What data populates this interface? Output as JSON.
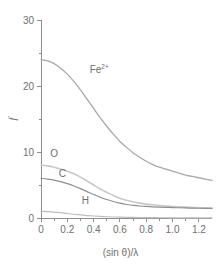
{
  "chart_data": {
    "type": "line",
    "title": "",
    "xlabel": "(sin θ)/λ",
    "ylabel": "f",
    "xlim": [
      0,
      1.3
    ],
    "ylim": [
      0,
      30
    ],
    "grid": false,
    "legend_position": "inline-labels",
    "x_ticks": [
      0,
      0.2,
      0.4,
      0.6,
      0.8,
      1.0,
      1.2
    ],
    "x_tick_labels": [
      "0",
      "0.2",
      "0.4",
      "0.6",
      "0.8",
      "1.0",
      "1.2"
    ],
    "x_minor_ticks": [
      0.1,
      0.3,
      0.5,
      0.7,
      0.9,
      1.1
    ],
    "y_ticks": [
      0,
      10,
      20,
      30
    ],
    "y_tick_labels": [
      "0",
      "10",
      "20",
      "30"
    ],
    "y_minor_ticks": [
      5,
      15,
      25
    ],
    "x": [
      0,
      0.05,
      0.1,
      0.15,
      0.2,
      0.25,
      0.3,
      0.35,
      0.4,
      0.45,
      0.5,
      0.55,
      0.6,
      0.65,
      0.7,
      0.75,
      0.8,
      0.85,
      0.9,
      0.95,
      1.0,
      1.05,
      1.1,
      1.15,
      1.2,
      1.25,
      1.3
    ],
    "series": [
      {
        "name": "Fe2+",
        "label": "Fe",
        "label_sup": "2+",
        "color": "#a8a8a8",
        "width": 1.3,
        "label_x": 0.37,
        "label_y": 22.0,
        "values": [
          24.0,
          23.8,
          23.4,
          22.7,
          21.8,
          20.7,
          19.4,
          18.0,
          16.6,
          15.2,
          13.9,
          12.7,
          11.6,
          10.7,
          9.9,
          9.2,
          8.6,
          8.1,
          7.7,
          7.4,
          7.1,
          6.8,
          6.5,
          6.3,
          6.1,
          5.9,
          5.7
        ]
      },
      {
        "name": "O",
        "label": "O",
        "label_sup": "",
        "color": "#c9c9c9",
        "width": 1.6,
        "label_x": 0.07,
        "label_y": 9.3,
        "values": [
          8.0,
          7.9,
          7.7,
          7.4,
          7.1,
          6.7,
          6.2,
          5.6,
          5.0,
          4.4,
          3.9,
          3.4,
          3.0,
          2.7,
          2.45,
          2.25,
          2.1,
          2.0,
          1.9,
          1.82,
          1.75,
          1.7,
          1.65,
          1.6,
          1.56,
          1.53,
          1.5
        ]
      },
      {
        "name": "C",
        "label": "C",
        "label_sup": "",
        "color": "#8f8f8f",
        "width": 1.2,
        "label_x": 0.135,
        "label_y": 6.2,
        "values": [
          6.0,
          5.9,
          5.75,
          5.5,
          5.2,
          4.85,
          4.45,
          4.0,
          3.55,
          3.15,
          2.8,
          2.5,
          2.25,
          2.05,
          1.92,
          1.82,
          1.75,
          1.7,
          1.66,
          1.62,
          1.58,
          1.55,
          1.52,
          1.5,
          1.48,
          1.46,
          1.45
        ]
      },
      {
        "name": "H",
        "label": "H",
        "label_sup": "",
        "color": "#bdbdbd",
        "width": 1.2,
        "label_x": 0.31,
        "label_y": 2.1,
        "values": [
          1.0,
          0.97,
          0.9,
          0.8,
          0.68,
          0.57,
          0.46,
          0.37,
          0.3,
          0.24,
          0.19,
          0.15,
          0.12,
          0.1,
          0.08,
          0.07,
          0.06,
          0.05,
          0.04,
          0.035,
          0.03,
          0.028,
          0.025,
          0.022,
          0.02,
          0.018,
          0.016
        ]
      }
    ]
  }
}
